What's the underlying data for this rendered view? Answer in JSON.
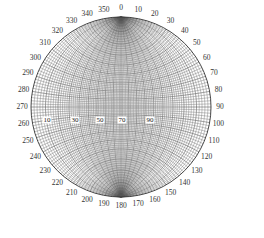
{
  "diagram": {
    "type": "stereonet",
    "projection": "equal-angle (Wulff) net",
    "center": [
      121,
      107
    ],
    "radius": 90,
    "grid_step_deg": 2,
    "colors": {
      "grid": "#555555",
      "outline": "#333333",
      "label": "#333333",
      "background": "#ffffff"
    },
    "azimuth_labels": [
      "0",
      "10",
      "20",
      "30",
      "40",
      "50",
      "60",
      "70",
      "80",
      "90",
      "100",
      "110",
      "120",
      "130",
      "140",
      "150",
      "160",
      "170",
      "180",
      "190",
      "200",
      "210",
      "220",
      "230",
      "240",
      "250",
      "260",
      "270",
      "280",
      "290",
      "300",
      "310",
      "320",
      "330",
      "340",
      "350"
    ],
    "dip_labels": [
      {
        "text": "10",
        "x": 47
      },
      {
        "text": "30",
        "x": 75
      },
      {
        "text": "50",
        "x": 100
      },
      {
        "text": "70",
        "x": 122
      },
      {
        "text": "90",
        "x": 150
      }
    ],
    "dip_labels_y": 120
  }
}
